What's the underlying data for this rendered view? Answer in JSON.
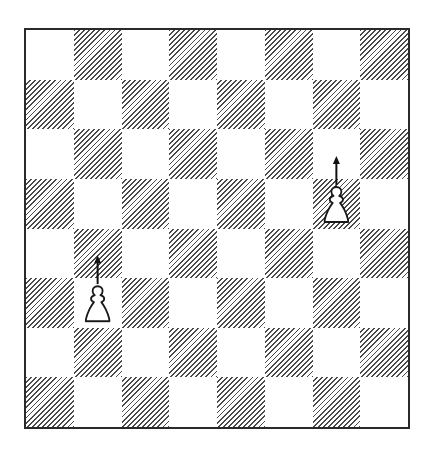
{
  "diagram": {
    "type": "chess-board",
    "files": [
      "a",
      "b",
      "c",
      "d",
      "e",
      "f",
      "g",
      "h"
    ],
    "ranks": [
      8,
      7,
      6,
      5,
      4,
      3,
      2,
      1
    ],
    "orientation": "white-at-bottom",
    "light_square_color": "#ffffff",
    "dark_square_style": "diagonal-hatch",
    "hatch_color": "#4a4a4a",
    "border_color": "#2a2a2a",
    "pieces": [
      {
        "square": "b3",
        "piece": "pawn",
        "color": "white",
        "icon": "white-pawn-icon"
      },
      {
        "square": "g5",
        "piece": "pawn",
        "color": "white",
        "icon": "white-pawn-icon"
      }
    ],
    "arrows": [
      {
        "from": "b3",
        "to": "b4",
        "direction": "up",
        "icon": "arrow-up-icon"
      },
      {
        "from": "g5",
        "to": "g6",
        "direction": "up",
        "icon": "arrow-up-icon"
      }
    ]
  }
}
